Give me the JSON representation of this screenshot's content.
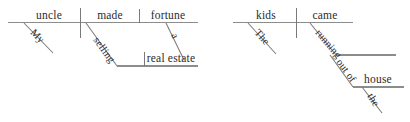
{
  "figure": {
    "type": "reed-kellogg-sentence-diagram",
    "background_color": "#ffffff",
    "line_color": "#8c8c8c",
    "text_color": "#2b2b2b"
  },
  "diagrams": [
    {
      "id": "diagram-left",
      "sentence": "My uncle made a fortune selling real estate.",
      "words": {
        "subject": "uncle",
        "subject_modifier": "My",
        "verb": "made",
        "direct_object": "fortune",
        "object_modifier": "a",
        "gerund": "selling",
        "gerund_object": "real estate"
      }
    },
    {
      "id": "diagram-right",
      "sentence": "The kids came running out of the house.",
      "words": {
        "subject": "kids",
        "subject_modifier": "The",
        "verb": "came",
        "participle": "running",
        "preposition": "out of",
        "prep_object": "house",
        "prep_object_modifier": "the"
      }
    }
  ],
  "labels": {
    "l_uncle": "uncle",
    "l_my": "My",
    "l_made": "made",
    "l_fortune": "fortune",
    "l_a": "a",
    "l_selling": "selling",
    "l_real_estate": "real estate",
    "r_kids": "kids",
    "r_the": "The",
    "r_came": "came",
    "r_running": "running",
    "r_out_of": "out of",
    "r_house": "house",
    "r_the2": "the"
  }
}
